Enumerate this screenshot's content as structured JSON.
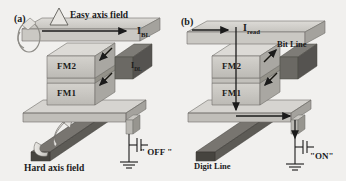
{
  "figure": {
    "background_color": "#f1f0ee",
    "ink_color": "#1b1b1b",
    "metal_light": "#d2d0cc",
    "metal_mid": "#b4b2ad",
    "metal_dark": "#8d8b86",
    "metal_darkest": "#5e5c58",
    "fm_fill": "#c9c7c2"
  },
  "panel_a": {
    "tag": "(a)",
    "easy_axis_label": "Easy axis field",
    "hard_axis_label": "Hard axis field",
    "bit_line_current": {
      "symbol": "I",
      "subscript": "BL"
    },
    "digit_line_current": {
      "symbol": "I",
      "subscript": "DL"
    },
    "layers": [
      {
        "name": "FM2",
        "magnetization": "down-left"
      },
      {
        "name": "FM1",
        "magnetization": "down-left"
      }
    ],
    "transistor_state": "\" OFF \"",
    "state_value": "OFF"
  },
  "panel_b": {
    "tag": "(b)",
    "read_current": {
      "symbol": "I",
      "subscript": "read"
    },
    "bit_line_label": "Bit Line",
    "digit_line_label": "Digit Line",
    "layers": [
      {
        "name": "FM2",
        "magnetization": "up-right"
      },
      {
        "name": "FM1",
        "magnetization": "down-left"
      }
    ],
    "transistor_state": "\"ON\"",
    "state_value": "ON"
  }
}
